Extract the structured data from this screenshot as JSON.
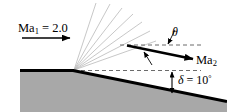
{
  "figure": {
    "type": "fluid-dynamics-schematic",
    "background_color": "#ffffff",
    "wedge_fill_color": "#a8a8a8",
    "wall_color": "#000000",
    "fan_line_color": "#b4b4b4",
    "dash_color": "#555555"
  },
  "labels": {
    "upstream_mach": {
      "prefix": "Ma",
      "subscript": "1",
      "equals": " = ",
      "value": "2.0",
      "full_text": "Ma1 = 2.0"
    },
    "downstream_mach": {
      "prefix": "Ma",
      "subscript": "2",
      "full_text": "Ma2"
    },
    "turn_angle": {
      "symbol": "θ",
      "full_text": "θ"
    },
    "deflection_angle": {
      "symbol": "δ",
      "equals": " = ",
      "value": "10",
      "unit": "°",
      "full_text": "δ = 10°"
    }
  },
  "geometry": {
    "corner_point": {
      "x": 74,
      "y": 70
    },
    "horizontal_wall": {
      "x1": 20,
      "y1": 70,
      "x2": 74,
      "y2": 70
    },
    "inclined_wall": {
      "x1": 74,
      "y1": 70,
      "x2": 227,
      "y2": 101
    },
    "wall_angle_degrees": 10,
    "upstream_arrow": {
      "x1": 22,
      "y1": 38,
      "x2": 72,
      "y2": 38
    },
    "downstream_arrow": {
      "x1": 127,
      "y1": 46,
      "x2": 196,
      "y2": 60
    },
    "dashed_line_corner": {
      "x1": 74,
      "y1": 70,
      "x2": 200,
      "y2": 70
    },
    "dashed_line_upper": {
      "x1": 120,
      "y1": 45,
      "x2": 200,
      "y2": 45
    },
    "fan_line_count": 7,
    "delta_arrow": {
      "x": 172,
      "y1": 70,
      "y2": 94
    }
  }
}
